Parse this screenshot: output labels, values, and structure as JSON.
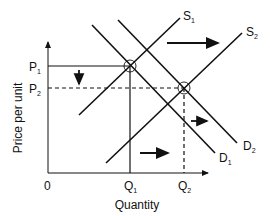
{
  "diagram": {
    "type": "supply-demand",
    "axes": {
      "x_label": "Quantity",
      "y_label": "Price per unit",
      "origin_label": "0"
    },
    "price_levels": [
      {
        "label": "P",
        "sub": "1"
      },
      {
        "label": "P",
        "sub": "2"
      }
    ],
    "quantity_levels": [
      {
        "label": "Q",
        "sub": "1"
      },
      {
        "label": "Q",
        "sub": "2"
      }
    ],
    "curves": {
      "s1": {
        "label": "S",
        "sub": "1"
      },
      "s2": {
        "label": "S",
        "sub": "2"
      },
      "d1": {
        "label": "D",
        "sub": "1"
      },
      "d2": {
        "label": "D",
        "sub": "2"
      }
    },
    "shifts": [
      "Supply shifts right from S1 to S2",
      "Demand shifts right from D1 to D2",
      "Price falls from P1 to P2",
      "Quantity rises from Q1 to Q2"
    ],
    "colors": {
      "ink": "#111111",
      "background": "#ffffff"
    }
  }
}
